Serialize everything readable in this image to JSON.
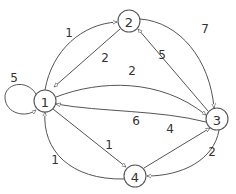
{
  "diagram": {
    "type": "directed-weighted-graph",
    "nodes": [
      {
        "id": "1",
        "label": "1",
        "x": 45,
        "y": 101
      },
      {
        "id": "2",
        "label": "2",
        "x": 129,
        "y": 21
      },
      {
        "id": "3",
        "label": "3",
        "x": 217,
        "y": 119
      },
      {
        "id": "4",
        "label": "4",
        "x": 135,
        "y": 176
      }
    ],
    "edges": [
      {
        "from": "1",
        "to": "1",
        "label": "5"
      },
      {
        "from": "1",
        "to": "2",
        "label": "1"
      },
      {
        "from": "2",
        "to": "1",
        "label": "2"
      },
      {
        "from": "2",
        "to": "3",
        "label": "7"
      },
      {
        "from": "3",
        "to": "2",
        "label": "5"
      },
      {
        "from": "1",
        "to": "3",
        "label": "2"
      },
      {
        "from": "3",
        "to": "1",
        "label": "6"
      },
      {
        "from": "1",
        "to": "4",
        "label": "1"
      },
      {
        "from": "4",
        "to": "1",
        "label": "1"
      },
      {
        "from": "4",
        "to": "3",
        "label": "4"
      },
      {
        "from": "3",
        "to": "4",
        "label": "2"
      }
    ]
  },
  "colors": {
    "stroke": "#555555",
    "text": "#333333",
    "background": "#ffffff"
  }
}
